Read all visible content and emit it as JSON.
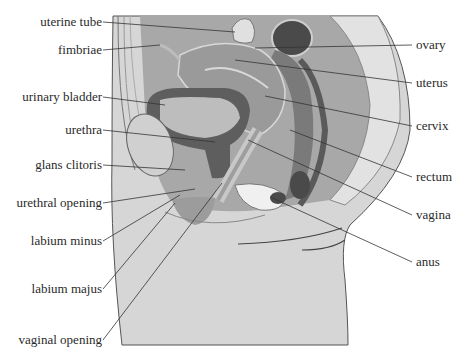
{
  "diagram": {
    "colors": {
      "background": "#ffffff",
      "body_fill": "#d6d6d6",
      "outline": "#555555",
      "dark_organ": "#5a5a5a",
      "mid_organ": "#8c8c8c",
      "light_tissue": "#b8b8b8",
      "leader_line": "#333333",
      "text": "#2a2a2a"
    },
    "labels_left": [
      {
        "id": "uterine-tube",
        "text": "uterine tube"
      },
      {
        "id": "fimbriae",
        "text": "fimbriae"
      },
      {
        "id": "urinary-bladder",
        "text": "urinary bladder"
      },
      {
        "id": "urethra",
        "text": "urethra"
      },
      {
        "id": "glans-clitoris",
        "text": "glans clitoris"
      },
      {
        "id": "urethral-opening",
        "text": "urethral opening"
      },
      {
        "id": "labium-minus",
        "text": "labium minus"
      },
      {
        "id": "labium-majus",
        "text": "labium majus"
      },
      {
        "id": "vaginal-opening",
        "text": "vaginal opening"
      }
    ],
    "labels_right": [
      {
        "id": "ovary",
        "text": "ovary"
      },
      {
        "id": "uterus",
        "text": "uterus"
      },
      {
        "id": "cervix",
        "text": "cervix"
      },
      {
        "id": "rectum",
        "text": "rectum"
      },
      {
        "id": "vagina",
        "text": "vagina"
      },
      {
        "id": "anus",
        "text": "anus"
      }
    ]
  }
}
